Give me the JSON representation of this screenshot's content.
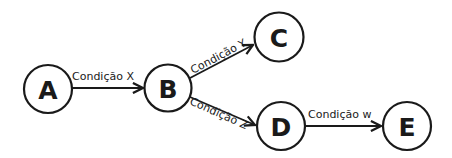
{
  "diagram": {
    "type": "state-flow",
    "colors": {
      "stroke": "#1a1a1a",
      "background": "#ffffff"
    },
    "nodes": [
      {
        "id": "A",
        "label": "A"
      },
      {
        "id": "B",
        "label": "B"
      },
      {
        "id": "C",
        "label": "C"
      },
      {
        "id": "D",
        "label": "D"
      },
      {
        "id": "E",
        "label": "E"
      }
    ],
    "edges": [
      {
        "from": "A",
        "to": "B",
        "label": "Condição X"
      },
      {
        "from": "B",
        "to": "C",
        "label": "Condição Y"
      },
      {
        "from": "B",
        "to": "D",
        "label": "Condição Z"
      },
      {
        "from": "D",
        "to": "E",
        "label": "Condição w"
      }
    ]
  }
}
